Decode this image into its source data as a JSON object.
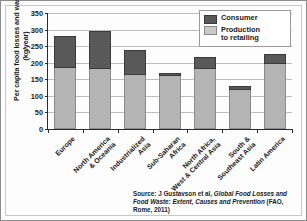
{
  "chart_data": {
    "type": "bar",
    "subtype": "stacked",
    "title": "",
    "xlabel": "",
    "ylabel": "Per capita food losses and waste (kg/year)",
    "ylim": [
      0,
      350
    ],
    "yticks": [
      0,
      50,
      100,
      150,
      200,
      250,
      300,
      350
    ],
    "grid": true,
    "legend_position": "top-right",
    "categories": [
      "Europe",
      "North America\n& Oceania",
      "Industrialized Asia",
      "Sub-Saharan\nAfrica",
      "North Africa,\nWest & Central Asia",
      "South &\nSoutheast Asia",
      "Latin America"
    ],
    "category_lines": [
      [
        "Europe"
      ],
      [
        "North America",
        "& Oceania"
      ],
      [
        "Industrialized",
        "Asia"
      ],
      [
        "Sub-Saharan",
        "Africa"
      ],
      [
        "North Africa,",
        "West & Central Asia"
      ],
      [
        "South &",
        "Southeast Asia"
      ],
      [
        "Latin America"
      ]
    ],
    "series": [
      {
        "name": "Production to retailing",
        "color": "#b4b4b4",
        "values": [
          184,
          180,
          162,
          161,
          181,
          117,
          197
        ]
      },
      {
        "name": "Consumer",
        "color": "#595959",
        "values": [
          98,
          115,
          76,
          8,
          35,
          12,
          28
        ]
      }
    ],
    "totals": [
      282,
      295,
      238,
      169,
      216,
      129,
      225
    ]
  },
  "legend": {
    "items": [
      {
        "label": "Consumer",
        "color": "#595959"
      },
      {
        "label": "Production\nto retailing",
        "color": "#c9c9c9"
      }
    ],
    "item_lines": [
      [
        "Consumer"
      ],
      [
        "Production",
        "to retailing"
      ]
    ]
  },
  "source": {
    "prefix": "Source: J Gustavson et al,",
    "italic_title": "Global Food Losses and Food Waste: Extent, Causes and Prevention",
    "suffix": "(FAO, Rome, 2011)"
  }
}
